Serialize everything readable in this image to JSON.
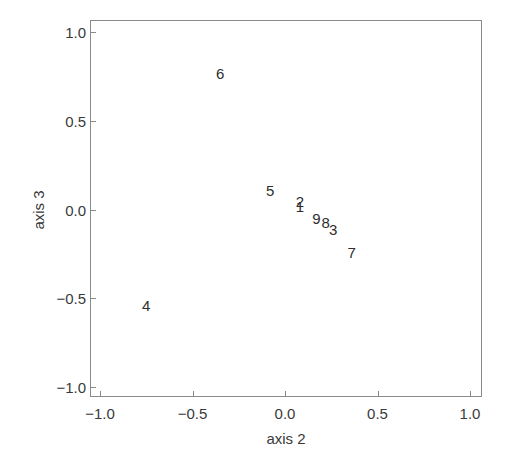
{
  "chart_data": {
    "type": "scatter",
    "title": "",
    "xlabel": "axis 2",
    "ylabel": "axis 3",
    "xlim": [
      -1.05,
      1.07
    ],
    "ylim": [
      -1.05,
      1.07
    ],
    "grid": false,
    "legend": null,
    "x_ticks": [
      -1.0,
      -0.5,
      0.0,
      0.5,
      1.0
    ],
    "x_tick_labels": [
      "−1.0",
      "−0.5",
      "0.0",
      "0.5",
      "1.0"
    ],
    "y_ticks": [
      1.0,
      0.5,
      0.0,
      -0.5,
      -1.0
    ],
    "y_tick_labels": [
      "1.0",
      "0.5",
      "0.0",
      "−0.5",
      "−1.0"
    ],
    "marker": "text-label",
    "points": [
      {
        "label": "1",
        "x": 0.08,
        "y": 0.02
      },
      {
        "label": "2",
        "x": 0.08,
        "y": 0.05
      },
      {
        "label": "3",
        "x": 0.26,
        "y": -0.11
      },
      {
        "label": "4",
        "x": -0.75,
        "y": -0.54
      },
      {
        "label": "5",
        "x": -0.08,
        "y": 0.11
      },
      {
        "label": "6",
        "x": -0.35,
        "y": 0.77
      },
      {
        "label": "7",
        "x": 0.36,
        "y": -0.24
      },
      {
        "label": "8",
        "x": 0.22,
        "y": -0.07
      },
      {
        "label": "9",
        "x": 0.17,
        "y": -0.05
      }
    ]
  },
  "colors": {
    "frame": "#8a8a8a",
    "text": "#3a3a3a",
    "background": "#ffffff"
  }
}
